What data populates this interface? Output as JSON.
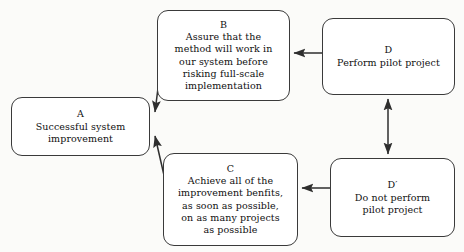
{
  "diagram": {
    "stroke_color": "#3a3a3a",
    "text_color": "#101010",
    "background_color": "#fbfbf9",
    "node_fill": "#ffffff",
    "nodes": {
      "a": {
        "label": "A",
        "lines": [
          "Successful system",
          "improvement"
        ]
      },
      "b": {
        "label": "B",
        "lines": [
          "Assure that the",
          "method will work in",
          "our system before",
          "risking full-scale",
          "implementation"
        ]
      },
      "c": {
        "label": "C",
        "lines": [
          "Achieve all of the",
          "improvement benfits,",
          "as soon as possible,",
          "on as many projects",
          "as possible"
        ]
      },
      "d": {
        "label": "D",
        "lines": [
          "Perform pilot project"
        ]
      },
      "dprime": {
        "label": "D′",
        "lines": [
          "Do not perform",
          "pilot project"
        ]
      }
    },
    "edges": [
      {
        "name": "edge-b-to-a",
        "from": "b",
        "to": "a",
        "style": "diagonal",
        "heads": "single"
      },
      {
        "name": "edge-c-to-a",
        "from": "c",
        "to": "a",
        "style": "diagonal",
        "heads": "single"
      },
      {
        "name": "edge-d-to-b",
        "from": "d",
        "to": "b",
        "style": "horizontal",
        "heads": "single"
      },
      {
        "name": "edge-dprime-to-c",
        "from": "dprime",
        "to": "c",
        "style": "horizontal",
        "heads": "single"
      },
      {
        "name": "edge-d-to-dprime",
        "from": "d",
        "to": "dprime",
        "style": "vertical",
        "heads": "double"
      }
    ]
  }
}
